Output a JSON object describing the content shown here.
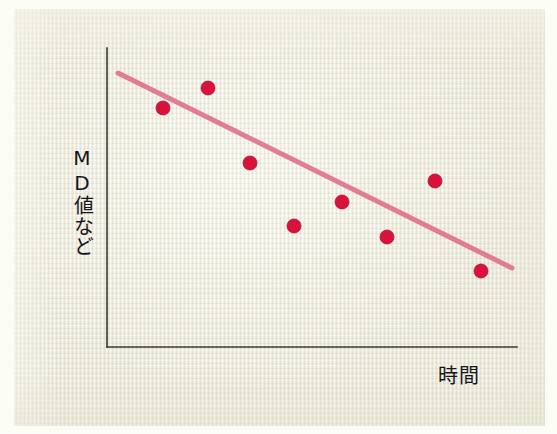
{
  "chart_data": {
    "type": "scatter",
    "title": "",
    "subtitle": "",
    "xlabel": "時間",
    "ylabel": "MD値など",
    "xticklabels": [],
    "yticklabels": [],
    "grid": false,
    "legend": null,
    "xlim": [
      0,
      10
    ],
    "ylim": [
      0,
      10
    ],
    "axis_style": "open-left-bottom-spines-only",
    "points": [
      {
        "x": 1.37,
        "y": 8.0,
        "px": 163,
        "py": 108
      },
      {
        "x": 1.86,
        "y": 8.67,
        "px": 208,
        "py": 88
      },
      {
        "x": 2.32,
        "y": 6.16,
        "px": 250,
        "py": 163
      },
      {
        "x": 2.8,
        "y": 4.05,
        "px": 294,
        "py": 226
      },
      {
        "x": 3.32,
        "y": 4.85,
        "px": 342,
        "py": 202
      },
      {
        "x": 3.81,
        "y": 3.68,
        "px": 387,
        "py": 237
      },
      {
        "x": 4.33,
        "y": 5.55,
        "px": 435,
        "py": 181
      },
      {
        "x": 4.83,
        "y": 2.54,
        "px": 481,
        "py": 271
      }
    ],
    "trendline": {
      "kind": "linear-fit",
      "x_start": 0.49,
      "y_start": 9.17,
      "x_end": 5.17,
      "y_end": 2.64,
      "px_start": 118,
      "py_start": 73,
      "px_end": 512,
      "py_end": 268,
      "slope_sign": "negative"
    },
    "colors": {
      "point_fill": "#d8123a",
      "point_edge": "#b50f30",
      "trendline": "#e0738d",
      "axis": "#3a3a35",
      "background": "#eceadb",
      "page": "#fdfdf8",
      "text": "#16161a"
    },
    "geometry": {
      "axis_x": 107,
      "axis_y": 347,
      "axis_top": 48,
      "axis_right": 517,
      "point_radius": 7,
      "trendline_width": 5,
      "axis_width": 1.6
    }
  }
}
